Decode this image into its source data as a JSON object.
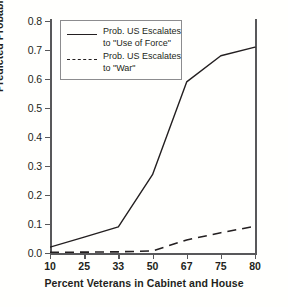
{
  "chart_data": {
    "type": "line",
    "title": "",
    "xlabel": "Percent Veterans in Cabinet and House",
    "ylabel": "Predicted Probability",
    "categories": [
      "10",
      "25",
      "33",
      "50",
      "67",
      "75",
      "80"
    ],
    "x_tick_labels": [
      "10",
      "25",
      "33",
      "50",
      "67",
      "75",
      "80"
    ],
    "y_tick_labels": [
      "0.0",
      "0.1",
      "0.2",
      "0.3",
      "0.4",
      "0.5",
      "0.6",
      "0.7",
      "0.8"
    ],
    "y_tick_values": [
      0.0,
      0.1,
      0.2,
      0.3,
      0.4,
      0.5,
      0.6,
      0.7,
      0.8
    ],
    "ylim": [
      0.0,
      0.8
    ],
    "xlim_categorical": true,
    "grid": false,
    "legend_position": "upper left inside",
    "series": [
      {
        "name": "Prob. US Escalates to \"Use of Force\"",
        "style": "solid",
        "color": "#231f20",
        "values": [
          0.02,
          0.055,
          0.09,
          0.27,
          0.59,
          0.68,
          0.71
        ]
      },
      {
        "name": "Prob. US Escalates to \"War\"",
        "style": "dashed",
        "color": "#231f20",
        "values": [
          0.002,
          0.003,
          0.004,
          0.007,
          0.045,
          0.07,
          0.092
        ]
      }
    ]
  },
  "legend": {
    "entries": [
      {
        "line1": "Prob. US Escalates",
        "line2": "to \"Use of Force\""
      },
      {
        "line1": "Prob. US Escalates",
        "line2": "to \"War\""
      }
    ]
  },
  "axes": {
    "y_title": "Predicted Probability",
    "x_title": "Percent Veterans in Cabinet and House"
  },
  "colors": {
    "ink": "#231f20",
    "axis": "#58585a",
    "legend_border": "#8c8c8e",
    "background": "#fffffd"
  }
}
